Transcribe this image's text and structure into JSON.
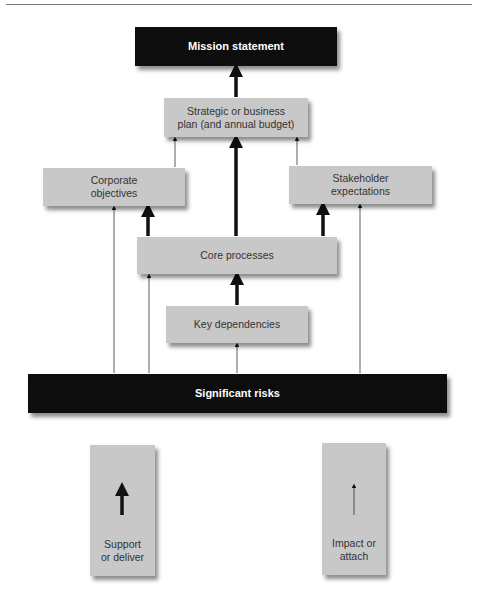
{
  "diagram": {
    "nodes": {
      "mission": {
        "label": "Mission statement"
      },
      "strategic": {
        "label_line1": "Strategic or business",
        "label_line2": "plan (and annual budget)"
      },
      "corporate": {
        "label_line1": "Corporate",
        "label_line2": "objectives"
      },
      "stakeholder": {
        "label_line1": "Stakeholder",
        "label_line2": "expectations"
      },
      "core": {
        "label": "Core processes"
      },
      "key": {
        "label": "Key dependencies"
      },
      "risks": {
        "label": "Significant risks"
      }
    },
    "edges": [
      {
        "from": "strategic",
        "to": "mission",
        "type": "support"
      },
      {
        "from": "corporate",
        "to": "strategic",
        "type": "impact"
      },
      {
        "from": "stakeholder",
        "to": "strategic",
        "type": "impact"
      },
      {
        "from": "core",
        "to": "strategic",
        "type": "support"
      },
      {
        "from": "core",
        "to": "corporate",
        "type": "support"
      },
      {
        "from": "core",
        "to": "stakeholder",
        "type": "support"
      },
      {
        "from": "key",
        "to": "core",
        "type": "support"
      },
      {
        "from": "risks",
        "to": "corporate",
        "type": "impact"
      },
      {
        "from": "risks",
        "to": "core",
        "type": "impact"
      },
      {
        "from": "risks",
        "to": "key",
        "type": "impact"
      },
      {
        "from": "risks",
        "to": "stakeholder",
        "type": "impact"
      }
    ]
  },
  "legend": {
    "support": {
      "line1": "Support",
      "line2": "or deliver"
    },
    "impact": {
      "line1": "Impact or",
      "line2": "attach"
    }
  },
  "colors": {
    "dark_box": "#0d0d0d",
    "light_box": "#c8c8c8",
    "arrow": "#111111"
  }
}
